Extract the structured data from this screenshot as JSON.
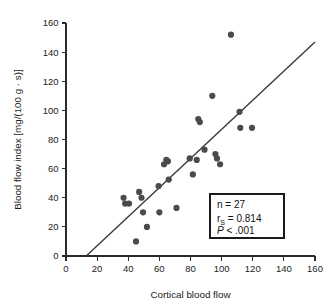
{
  "chart_data": {
    "type": "scatter",
    "title": "",
    "xlabel": "Cortical blood flow",
    "ylabel": "Blood flow index [mg/(100 g · s)]",
    "xlim": [
      0,
      160
    ],
    "ylim": [
      0,
      160
    ],
    "xticks": [
      0,
      20,
      40,
      60,
      80,
      100,
      120,
      140,
      160
    ],
    "yticks": [
      0,
      20,
      40,
      60,
      80,
      100,
      120,
      140,
      160
    ],
    "xtick_labels": [
      "0",
      "20",
      "40",
      "60",
      "80",
      "100",
      "120",
      "140",
      "160"
    ],
    "ytick_labels": [
      "0",
      "20",
      "40",
      "60",
      "80",
      "100",
      "120",
      "140",
      "160"
    ],
    "grid": false,
    "legend": "none",
    "marker_color": "#4a4a4f",
    "line_color": "#3a3a3a",
    "points": [
      {
        "x": 37,
        "y": 40
      },
      {
        "x": 38,
        "y": 36
      },
      {
        "x": 40.5,
        "y": 36
      },
      {
        "x": 47,
        "y": 44
      },
      {
        "x": 48.5,
        "y": 40
      },
      {
        "x": 49.5,
        "y": 30
      },
      {
        "x": 45,
        "y": 10
      },
      {
        "x": 52,
        "y": 20
      },
      {
        "x": 59.5,
        "y": 48
      },
      {
        "x": 60,
        "y": 30
      },
      {
        "x": 63,
        "y": 63
      },
      {
        "x": 64.5,
        "y": 66
      },
      {
        "x": 65.5,
        "y": 65
      },
      {
        "x": 66,
        "y": 52.5
      },
      {
        "x": 71,
        "y": 33
      },
      {
        "x": 79.5,
        "y": 67
      },
      {
        "x": 81.5,
        "y": 56
      },
      {
        "x": 84,
        "y": 66
      },
      {
        "x": 85,
        "y": 94
      },
      {
        "x": 86,
        "y": 92
      },
      {
        "x": 89,
        "y": 73
      },
      {
        "x": 94,
        "y": 110
      },
      {
        "x": 96,
        "y": 70
      },
      {
        "x": 97,
        "y": 67
      },
      {
        "x": 99,
        "y": 63
      },
      {
        "x": 106,
        "y": 152
      },
      {
        "x": 111.5,
        "y": 99
      },
      {
        "x": 112,
        "y": 88
      },
      {
        "x": 119.5,
        "y": 88
      }
    ],
    "fit_line": {
      "x_start": 13,
      "y_start": 0,
      "x_end": 160,
      "y_end": 147
    },
    "annotation": {
      "n_label": "n",
      "n_value": "27",
      "r_label": "r",
      "r_subscript": "S",
      "r_value": "0.814",
      "p_label": "P",
      "p_value": "< .001",
      "line1": "n = 27",
      "line2": "0.814",
      "line3": "< .001"
    }
  }
}
